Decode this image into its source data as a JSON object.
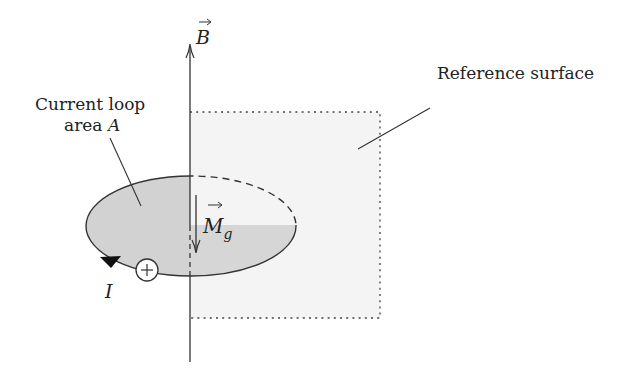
{
  "diagram": {
    "type": "physics-diagram",
    "labels": {
      "field_vector": "B",
      "loop_label_line1": "Current loop",
      "loop_label_line2_prefix": "area ",
      "loop_label_line2_symbol": "A",
      "moment_vector": "M",
      "moment_subscript": "g",
      "surface_label": "Reference surface",
      "current_symbol": "I",
      "source_symbol": "+"
    },
    "colors": {
      "line": "#333333",
      "loop_fill": "#d2d2d2",
      "surface_fill": "#f4f4f4",
      "arrowhead": "#111111"
    }
  }
}
